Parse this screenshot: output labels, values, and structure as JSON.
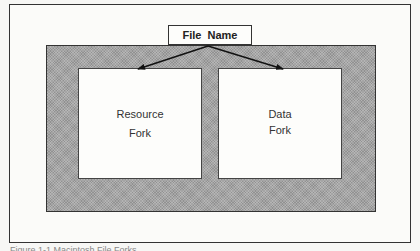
{
  "diagram": {
    "file_name_label": "File Name",
    "forks": [
      {
        "line1": "Resource",
        "line2": "Fork"
      },
      {
        "line1": "Data",
        "line2": "Fork"
      }
    ],
    "edges": [
      {
        "from": "File Name",
        "to": "Resource Fork"
      },
      {
        "from": "File Name",
        "to": "Data Fork"
      }
    ],
    "caption": "Figure 1-1 Macintosh File Forks"
  },
  "colors": {
    "container_fill": "#a5a5a5",
    "box_fill": "#fdfdfb",
    "stroke": "#333333"
  }
}
